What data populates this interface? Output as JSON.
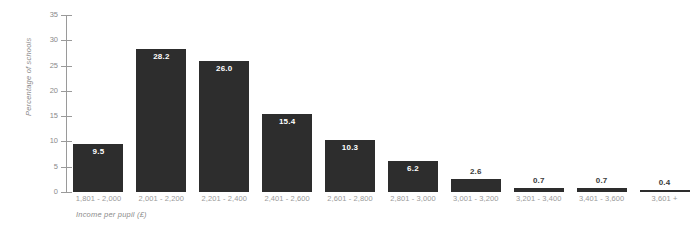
{
  "chart_data": {
    "type": "bar",
    "title": "",
    "subtitle": "",
    "xlabel": "Income per pupil (£)",
    "ylabel": "Percentage of schools",
    "categories": [
      "1,801 - 2,000",
      "2,001 - 2,200",
      "2,201 - 2,400",
      "2,401 - 2,600",
      "2,601 - 2,800",
      "2,801 - 3,000",
      "3,001 - 3,200",
      "3,201 - 3,400",
      "3,401 - 3,600",
      "3,601 +"
    ],
    "values": [
      9.5,
      28.2,
      26.0,
      15.4,
      10.3,
      6.2,
      2.6,
      0.7,
      0.7,
      0.4
    ],
    "value_labels": [
      "9.5",
      "28.2",
      "26.0",
      "15.4",
      "10.3",
      "6.2",
      "2.6",
      "0.7",
      "0.7",
      "0.4"
    ],
    "ylim": [
      0,
      35
    ],
    "ytick_values": [
      0,
      5,
      10,
      15,
      20,
      25,
      30,
      35
    ],
    "ytick_labels": [
      "0",
      "5",
      "10",
      "15",
      "20",
      "25",
      "30",
      "35"
    ],
    "grid": false,
    "legend": false,
    "legend_position": "none",
    "bar_color": "#2d2d2d",
    "axis_color": "#9a9a9a",
    "label_color": "#8a8a8a",
    "background_color": "#ffffff"
  }
}
